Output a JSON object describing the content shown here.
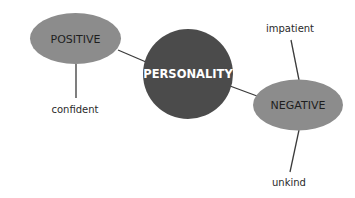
{
  "diagram": {
    "type": "mind-map",
    "center": {
      "label": "PERSONALITY",
      "color": "#4b4b4b"
    },
    "branches": [
      {
        "label": "POSITIVE",
        "color": "#8c8c8c",
        "children": [
          "confident"
        ]
      },
      {
        "label": "NEGATIVE",
        "color": "#8c8c8c",
        "children": [
          "impatient",
          "unkind"
        ]
      }
    ]
  },
  "labels": {
    "center": "PERSONALITY",
    "positive": "POSITIVE",
    "negative": "NEGATIVE",
    "confident": "confident",
    "impatient": "impatient",
    "unkind": "unkind"
  },
  "colors": {
    "center_fill": "#4b4b4b",
    "branch_fill": "#8c8c8c",
    "line": "#3a3a3a"
  }
}
